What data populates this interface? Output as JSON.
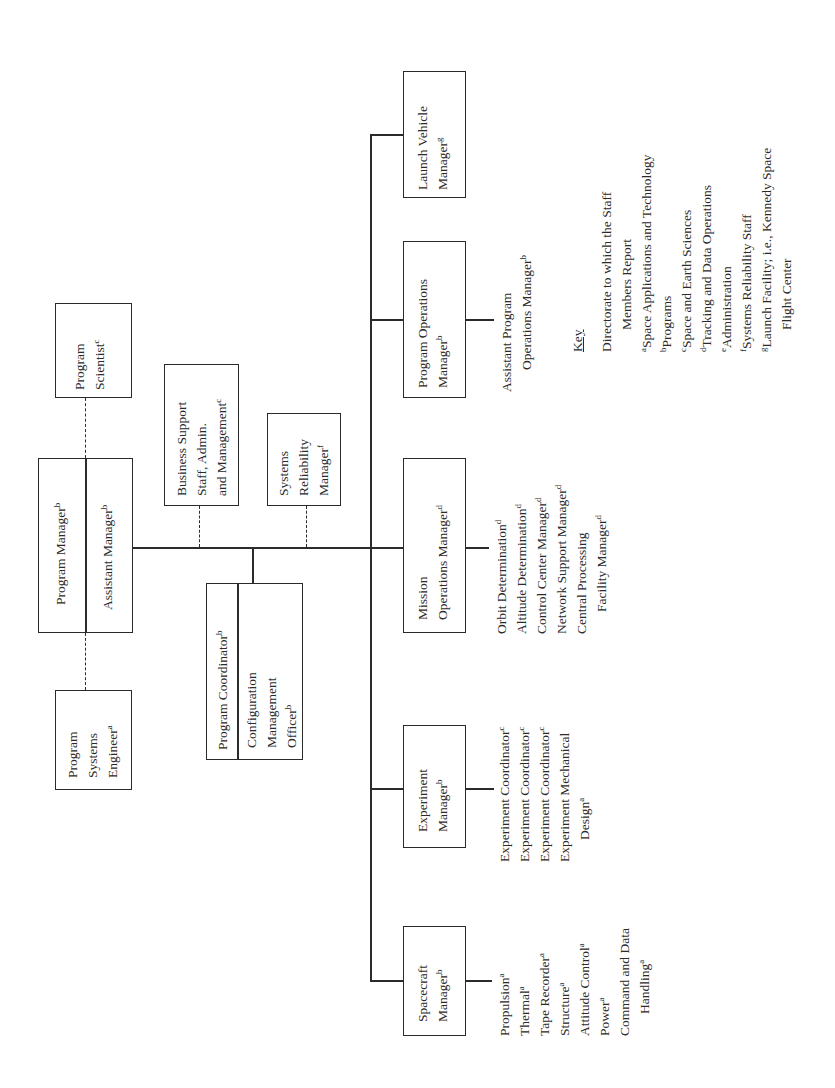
{
  "diagram": {
    "orientation": "rotated-90-ccw",
    "top_level": {
      "program_manager": {
        "label": "Program Manager",
        "sup": "b"
      },
      "assistant_manager": {
        "label": "Assistant Manager",
        "sup": "b"
      },
      "program_scientist": {
        "line1": "Program",
        "line2": "Scientist",
        "sup": "c"
      },
      "program_systems_engineer": {
        "line1": "Program",
        "line2": "Systems",
        "line3": "Engineer",
        "sup": "a"
      }
    },
    "staff": {
      "business_support": {
        "line1": "Business Support",
        "line2": "Staff, Admin.",
        "line3": "and Management",
        "sup": "c"
      },
      "systems_reliability": {
        "line1": "Systems",
        "line2": "Reliability",
        "line3": "Manager",
        "sup": "f"
      },
      "program_coordinator": {
        "label": "Program Coordinator",
        "sup": "b"
      },
      "config_mgmt_officer": {
        "line1": "Configuration",
        "line2": "Management",
        "line3": "Officer",
        "sup": "b"
      }
    },
    "line_managers": [
      {
        "id": "launch-vehicle",
        "line1": "Launch Vehicle",
        "line2": "Manager",
        "sup": "g",
        "items": []
      },
      {
        "id": "program-operations",
        "line1": "Program Operations",
        "line2": "Manager",
        "sup": "b",
        "items": [
          {
            "text": "Assistant Program",
            "sup": ""
          },
          {
            "text": "Operations Manager",
            "sup": "b",
            "indent": true
          }
        ]
      },
      {
        "id": "mission-operations",
        "line1": "Mission",
        "line2": "Operations Manager",
        "sup": "d",
        "items": [
          {
            "text": "Orbit Determination",
            "sup": "d"
          },
          {
            "text": "Altitude Determination",
            "sup": "d"
          },
          {
            "text": "Control Center Manager",
            "sup": "d"
          },
          {
            "text": "Network Support Manager",
            "sup": "d"
          },
          {
            "text": "Central Processing",
            "sup": ""
          },
          {
            "text": "Facility Manager",
            "sup": "d",
            "indent": true
          }
        ]
      },
      {
        "id": "experiment",
        "line1": "Experiment",
        "line2": "Manager",
        "sup": "b",
        "items": [
          {
            "text": "Experiment Coordinator",
            "sup": "c"
          },
          {
            "text": "Experiment Coordinator",
            "sup": "c"
          },
          {
            "text": "Experiment Coordinator",
            "sup": "c"
          },
          {
            "text": "Experiment Mechanical",
            "sup": ""
          },
          {
            "text": "Design",
            "sup": "a",
            "indent": true
          }
        ]
      },
      {
        "id": "spacecraft",
        "line1": "Spacecraft",
        "line2": "Manager",
        "sup": "b",
        "items": [
          {
            "text": "Propulsion",
            "sup": "a"
          },
          {
            "text": "Thermal",
            "sup": "a"
          },
          {
            "text": "Tape Recorder",
            "sup": "a"
          },
          {
            "text": "Structure",
            "sup": "a"
          },
          {
            "text": "Attitude Control",
            "sup": "a"
          },
          {
            "text": "Power",
            "sup": "a"
          },
          {
            "text": "Command and Data",
            "sup": ""
          },
          {
            "text": "Handling",
            "sup": "a",
            "indent": true
          }
        ]
      }
    ],
    "key": {
      "title": "Key",
      "heading_line1": "Directorate to which the Staff",
      "heading_line2": "Members Report",
      "entries": [
        {
          "sup": "a",
          "text": "Space Applications and Technology"
        },
        {
          "sup": "b",
          "text": "Programs"
        },
        {
          "sup": "c",
          "text": "Space and Earth Sciences"
        },
        {
          "sup": "d",
          "text": "Tracking and Data Operations"
        },
        {
          "sup": "e",
          "text": "Administration"
        },
        {
          "sup": "f",
          "text": "Systems Reliability Staff"
        },
        {
          "sup": "g",
          "text": "Launch Facility; i.e., Kennedy Space"
        },
        {
          "sup": "",
          "text": "Flight Center",
          "indent": true
        }
      ]
    }
  }
}
